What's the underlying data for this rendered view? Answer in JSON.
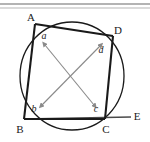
{
  "figure": {
    "type": "geometry-diagram",
    "background_color": "#ffffff",
    "stroke_color": "#1a1a1a",
    "arrow_color": "#8a8a8a",
    "top_rule_color": "#9a9a9a"
  },
  "vertices": [
    {
      "id": "A",
      "label": "A",
      "x": 35,
      "y": 24,
      "label_x": 31,
      "label_y": 21
    },
    {
      "id": "D",
      "label": "D",
      "x": 113,
      "y": 36,
      "label_x": 115,
      "label_y": 34
    },
    {
      "id": "B",
      "label": "B",
      "x": 24,
      "y": 119,
      "label_x": 20,
      "label_y": 131
    },
    {
      "id": "C",
      "label": "C",
      "x": 105,
      "y": 119,
      "label_x": 104,
      "label_y": 131
    },
    {
      "id": "E",
      "label": "E",
      "x": 131,
      "y": 117,
      "label_x": 134,
      "label_y": 119
    }
  ],
  "angle_labels": [
    {
      "id": "a",
      "label": "a",
      "at_vertex": "A",
      "x": 44,
      "y": 38
    },
    {
      "id": "b",
      "label": "b",
      "at_vertex": "B",
      "x": 34,
      "y": 110
    },
    {
      "id": "c",
      "label": "c",
      "at_vertex": "C",
      "x": 96,
      "y": 110
    },
    {
      "id": "d",
      "label": "d",
      "at_vertex": "D",
      "x": 101,
      "y": 52
    }
  ],
  "circle": {
    "center_x": 72,
    "center_y": 76,
    "radius_x": 52,
    "radius_y": 54
  },
  "quadrilateral": {
    "path": "M 35 24 L 113 36 L 105 119 L 24 119 Z",
    "sides": [
      {
        "id": "AD",
        "from": "A",
        "to": "D"
      },
      {
        "id": "DC",
        "from": "D",
        "to": "C"
      },
      {
        "id": "CB",
        "from": "C",
        "to": "B"
      },
      {
        "id": "BA",
        "from": "B",
        "to": "A"
      }
    ]
  },
  "extension_line": {
    "id": "BCE",
    "from_x": 24,
    "from_y": 119,
    "to_x": 131,
    "to_y": 117
  },
  "arrows": [
    {
      "id": "arrow-a-c",
      "pairs": "a-c",
      "from_x": 45,
      "from_y": 45,
      "to_x": 94,
      "to_y": 105,
      "double_headed": true
    },
    {
      "id": "arrow-b-d",
      "pairs": "b-d",
      "from_x": 42,
      "from_y": 105,
      "to_x": 100,
      "to_y": 46,
      "double_headed": true
    }
  ],
  "top_rules": [
    {
      "id": "top-rule-1",
      "y": 4
    },
    {
      "id": "top-rule-2",
      "y": 8
    }
  ]
}
